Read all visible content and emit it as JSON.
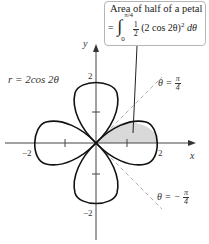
{
  "callout": {
    "title": "Area of half of a petal",
    "equals": "=",
    "integral": "∫",
    "upper_limit": "π/4",
    "lower_limit": "0",
    "half_num": "1",
    "half_den": "2",
    "integrand": "(2 cos 2θ)",
    "exp": "2",
    "dtheta": "dθ"
  },
  "labels": {
    "curve_equation": "r = 2cos 2θ",
    "y_axis": "y",
    "x_axis": "x",
    "x_neg2": "−2",
    "x_pos2": "2",
    "y_pos2": "2",
    "y_neg2": "−2",
    "theta_pos": "θ =",
    "theta_pos_num": "π",
    "theta_pos_den": "4",
    "theta_neg": "θ = −",
    "theta_neg_num": "π",
    "theta_neg_den": "4"
  },
  "colors": {
    "curve": "#111111",
    "shaded": "#d9d9d9",
    "dashed": "#b0b0b0",
    "callout_border": "#b5b5b5"
  },
  "geometry": {
    "origin": [
      96,
      143
    ],
    "scale_px_per_unit": 31
  }
}
